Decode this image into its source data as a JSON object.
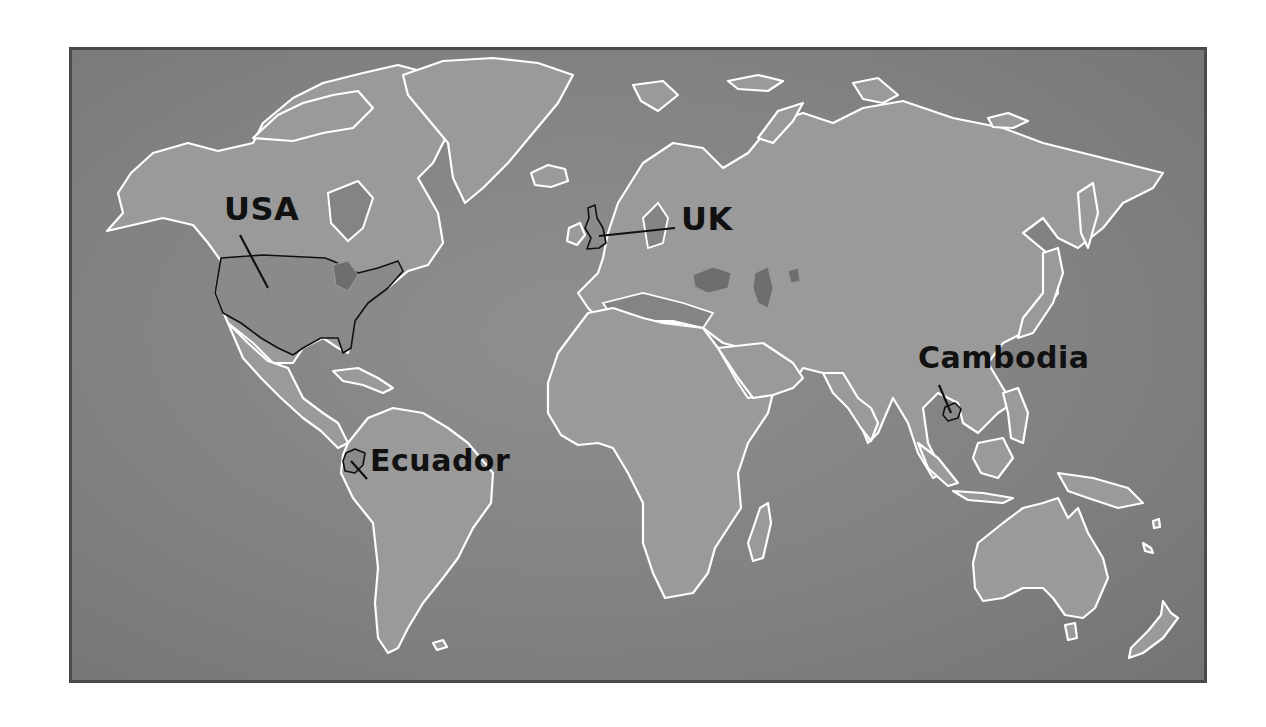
{
  "map": {
    "type": "world-outline-map",
    "colors": {
      "ocean": "#828282",
      "land": "#9a9a9a",
      "coastline": "#ffffff",
      "highlight_outline": "#111111",
      "label_text": "#111111",
      "frame_border": "#4a4a4a",
      "page_background": "#ffffff"
    },
    "labels": [
      {
        "id": "usa",
        "text": "USA"
      },
      {
        "id": "uk",
        "text": "UK"
      },
      {
        "id": "ecuador",
        "text": "Ecuador"
      },
      {
        "id": "cambodia",
        "text": "Cambodia"
      }
    ]
  }
}
